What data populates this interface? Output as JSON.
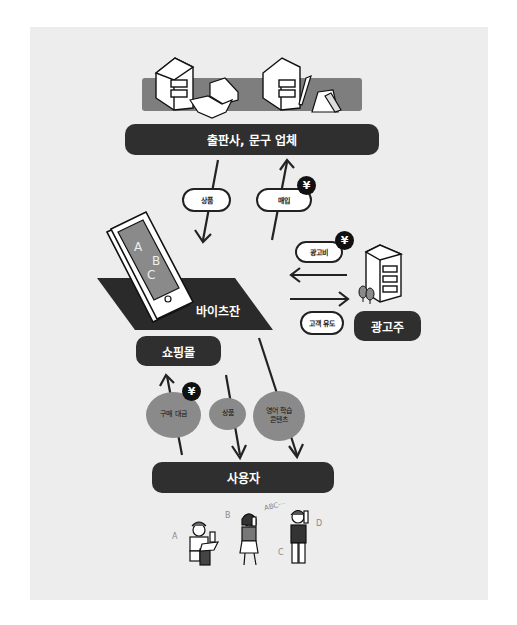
{
  "diagram": {
    "nodes": {
      "suppliers": "출판사, 문구 업체",
      "platform": "바이츠잔",
      "shop": "쇼핑몰",
      "advertiser": "광고주",
      "users": "사용자"
    },
    "edge_labels": {
      "goods_down": "상품",
      "purchase_up": "매입",
      "ad_fee": "광고비",
      "customer_referral": "고객 유도",
      "purchase_payment": "구매 대금",
      "goods_to_users": "상품",
      "english_content_line1": "영어 학습",
      "english_content_line2": "콘텐츠"
    },
    "currency_symbol": "¥",
    "phone_screen_letters": [
      "A",
      "B",
      "C"
    ],
    "user_labels": [
      "A",
      "B",
      "C",
      "D"
    ],
    "speech_text": "ABC⋯",
    "colors": {
      "panel_bg": "#ededed",
      "dark_box": "#2f2f2f",
      "mid_gray": "#8a8a8a",
      "black": "#111111"
    }
  }
}
